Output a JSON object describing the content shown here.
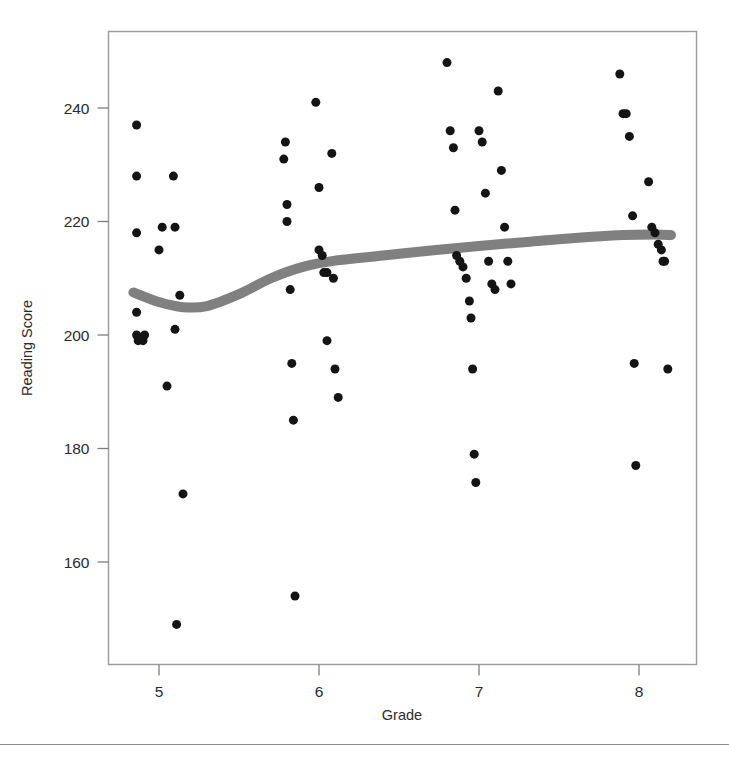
{
  "figure": {
    "background_color": "#ffffff",
    "frame_color": "#9a9a9a",
    "point_color": "#141414",
    "curve_color": "#808080"
  },
  "axis": {
    "x_title": "Grade",
    "y_title": "Reading Score",
    "x_ticks": [
      "5",
      "6",
      "7",
      "8"
    ],
    "y_ticks": [
      "160",
      "180",
      "200",
      "220",
      "240"
    ]
  },
  "chart_data": {
    "type": "scatter",
    "title": "",
    "xlabel": "Grade",
    "ylabel": "Reading Score",
    "xlim": [
      4.72,
      8.3
    ],
    "ylim": [
      146,
      251
    ],
    "xticks": [
      5,
      6,
      7,
      8
    ],
    "yticks": [
      160,
      180,
      200,
      220,
      240
    ],
    "grid": false,
    "legend": "none",
    "marker": "filled-circle",
    "marker_size_px": 9,
    "series": [
      {
        "name": "Students",
        "points": [
          [
            4.86,
            237
          ],
          [
            4.86,
            218
          ],
          [
            4.86,
            204
          ],
          [
            4.86,
            200
          ],
          [
            4.87,
            199
          ],
          [
            4.9,
            199
          ],
          [
            4.91,
            200
          ],
          [
            4.86,
            228
          ],
          [
            5.0,
            215
          ],
          [
            5.02,
            219
          ],
          [
            5.05,
            191
          ],
          [
            5.09,
            228
          ],
          [
            5.1,
            219
          ],
          [
            5.1,
            201
          ],
          [
            5.11,
            149
          ],
          [
            5.13,
            207
          ],
          [
            5.15,
            172
          ],
          [
            5.78,
            231
          ],
          [
            5.79,
            234
          ],
          [
            5.8,
            223
          ],
          [
            5.8,
            220
          ],
          [
            5.82,
            208
          ],
          [
            5.83,
            195
          ],
          [
            5.84,
            185
          ],
          [
            5.85,
            154
          ],
          [
            5.98,
            241
          ],
          [
            6.0,
            226
          ],
          [
            6.0,
            215
          ],
          [
            6.02,
            214
          ],
          [
            6.03,
            211
          ],
          [
            6.05,
            211
          ],
          [
            6.05,
            199
          ],
          [
            6.08,
            232
          ],
          [
            6.09,
            210
          ],
          [
            6.1,
            194
          ],
          [
            6.12,
            189
          ],
          [
            6.8,
            248
          ],
          [
            6.82,
            236
          ],
          [
            6.84,
            233
          ],
          [
            6.85,
            222
          ],
          [
            6.86,
            214
          ],
          [
            6.88,
            213
          ],
          [
            6.9,
            212
          ],
          [
            6.92,
            210
          ],
          [
            6.94,
            206
          ],
          [
            6.95,
            203
          ],
          [
            6.96,
            194
          ],
          [
            6.97,
            179
          ],
          [
            6.98,
            174
          ],
          [
            7.0,
            236
          ],
          [
            7.02,
            234
          ],
          [
            7.04,
            225
          ],
          [
            7.06,
            213
          ],
          [
            7.08,
            209
          ],
          [
            7.1,
            208
          ],
          [
            7.12,
            243
          ],
          [
            7.14,
            229
          ],
          [
            7.16,
            219
          ],
          [
            7.18,
            213
          ],
          [
            7.2,
            209
          ],
          [
            7.88,
            246
          ],
          [
            7.9,
            239
          ],
          [
            7.92,
            239
          ],
          [
            7.94,
            235
          ],
          [
            7.96,
            221
          ],
          [
            7.97,
            195
          ],
          [
            7.98,
            177
          ],
          [
            8.06,
            227
          ],
          [
            8.08,
            219
          ],
          [
            8.1,
            218
          ],
          [
            8.12,
            216
          ],
          [
            8.14,
            215
          ],
          [
            8.15,
            213
          ],
          [
            8.16,
            213
          ],
          [
            8.18,
            194
          ]
        ]
      }
    ],
    "trend": {
      "name": "loess smooth",
      "style": "thick-gray-band",
      "thickness_px": 10,
      "points": [
        [
          4.84,
          207.5
        ],
        [
          5.0,
          205.8
        ],
        [
          5.15,
          204.9
        ],
        [
          5.3,
          205.1
        ],
        [
          5.5,
          207.2
        ],
        [
          5.7,
          210.0
        ],
        [
          5.9,
          212.0
        ],
        [
          6.1,
          213.1
        ],
        [
          6.4,
          214.0
        ],
        [
          6.7,
          214.9
        ],
        [
          7.0,
          215.7
        ],
        [
          7.3,
          216.4
        ],
        [
          7.6,
          217.1
        ],
        [
          7.9,
          217.6
        ],
        [
          8.1,
          217.7
        ],
        [
          8.2,
          217.6
        ]
      ]
    }
  }
}
